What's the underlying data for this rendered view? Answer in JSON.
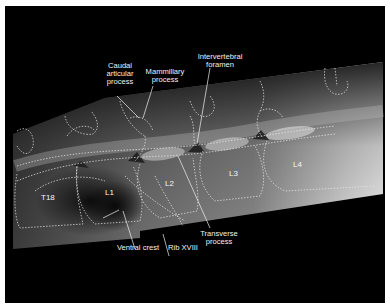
{
  "figure": {
    "type": "lateral radiograph with anatomical tracing",
    "vertebra_labels": [
      "T18",
      "L1",
      "L2",
      "L3",
      "L4"
    ],
    "annotations": [
      {
        "id": "caudal-articular-process",
        "text": "Caudal\narticular\nprocess"
      },
      {
        "id": "mammillary-process",
        "text": "Mammillary\nprocess"
      },
      {
        "id": "intervertebral-foramen",
        "text": "Intervertebral\nforamen"
      },
      {
        "id": "ventral-crest",
        "text": "Ventral crest"
      },
      {
        "id": "rib-xviii",
        "text": "Rib XVIII"
      },
      {
        "id": "transverse-process",
        "text": "Transverse\nprocess"
      }
    ],
    "colors": {
      "background": "#000000",
      "border": "#ffffff",
      "text": "#f2f2f2",
      "tracing": "#e8e8e8"
    }
  }
}
